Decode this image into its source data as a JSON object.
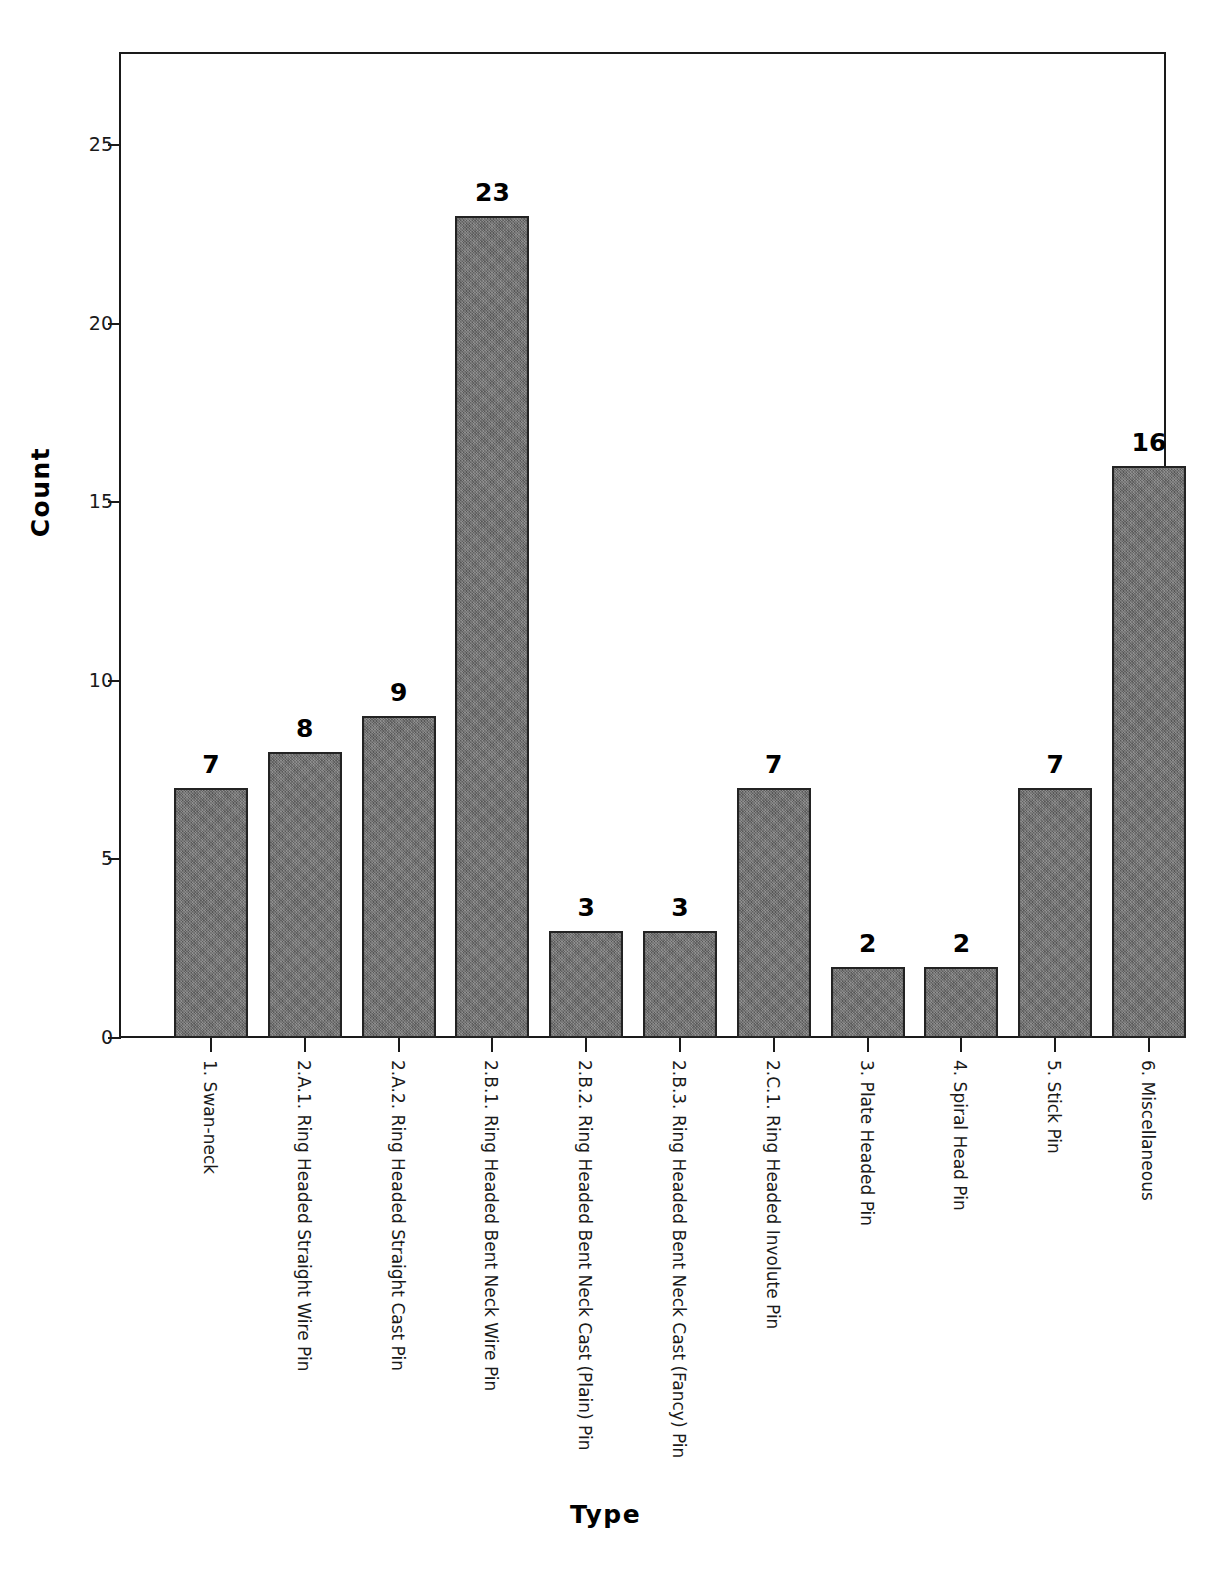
{
  "chart_data": {
    "type": "bar",
    "title": "",
    "xlabel": "Type",
    "ylabel": "Count",
    "ylim": [
      0,
      27.6
    ],
    "yticks": [
      0,
      5,
      10,
      15,
      20,
      25
    ],
    "ytick_labels": [
      "0",
      "5",
      "10",
      "15",
      "20",
      "25"
    ],
    "grid": false,
    "legend": "none",
    "bar_color": "#6f6f6f",
    "bar_edge_color": "#232323",
    "categories": [
      "1. Swan-neck",
      "2.A.1. Ring Headed Straight Wire Pin",
      "2.A.2. Ring Headed Straight Cast Pin",
      "2.B.1. Ring Headed Bent Neck Wire Pin",
      "2.B.2. Ring Headed Bent Neck Cast (Plain) Pin",
      "2.B.3. Ring Headed Bent Neck Cast (Fancy) Pin",
      "2.C.1. Ring Headed Involute Pin",
      "3. Plate Headed Pin",
      "4. Spiral Head Pin",
      "5. Stick Pin",
      "6. Miscellaneous"
    ],
    "values": [
      7,
      8,
      9,
      23,
      3,
      3,
      7,
      2,
      2,
      7,
      16
    ],
    "value_labels": [
      "7",
      "8",
      "9",
      "23",
      "3",
      "3",
      "7",
      "2",
      "2",
      "7",
      "16"
    ]
  },
  "axes": {
    "y_title": "Count",
    "x_title": "Type"
  },
  "caption": {
    "text": ""
  }
}
